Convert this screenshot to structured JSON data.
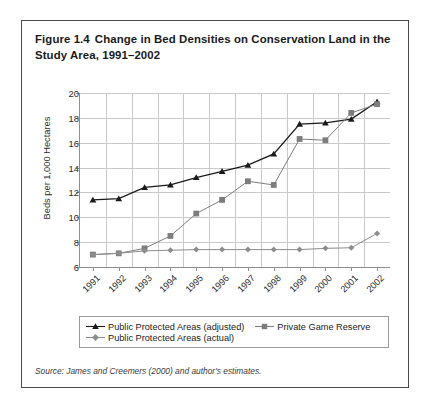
{
  "figure": {
    "number": "Figure 1.4",
    "title": "Change in Bed Densities on Conservation Land in the Study Area, 1991–2002",
    "source_note": "Source: James and Creemers (2000) and author's estimates."
  },
  "legend": {
    "entries": [
      {
        "label": "Public Protected Areas (adjusted)",
        "marker": "triangle-marker",
        "color": "#1a1a1a"
      },
      {
        "label": "Private Game Reserve",
        "marker": "square-marker",
        "color": "#7d7d7d"
      },
      {
        "label": "Public Protected Areas (actual)",
        "marker": "diamond-marker",
        "color": "#8c8c8c"
      }
    ]
  },
  "chart_data": {
    "type": "line",
    "title": "Change in Bed Densities on Conservation Land in the Study Area, 1991–2002",
    "xlabel": "",
    "ylabel": "Beds per 1,000 Hectares",
    "categories": [
      "1991",
      "1992",
      "1993",
      "1994",
      "1995",
      "1996",
      "1997",
      "1998",
      "1999",
      "2000",
      "2001",
      "2002"
    ],
    "ylim": [
      6,
      20
    ],
    "yticks": [
      6,
      8,
      10,
      12,
      14,
      16,
      18,
      20
    ],
    "grid": true,
    "legend_position": "bottom",
    "series": [
      {
        "name": "Public Protected Areas (adjusted)",
        "color": "#1a1a1a",
        "marker": "triangle",
        "values": [
          11.4,
          11.5,
          12.4,
          12.6,
          13.2,
          13.7,
          14.2,
          15.1,
          17.5,
          17.6,
          17.9,
          19.3
        ]
      },
      {
        "name": "Private Game Reserve",
        "color": "#7d7d7d",
        "marker": "square",
        "values": [
          7.0,
          7.1,
          7.5,
          8.5,
          10.3,
          11.4,
          12.9,
          12.6,
          16.3,
          16.2,
          18.4,
          19.1
        ]
      },
      {
        "name": "Public Protected Areas (actual)",
        "color": "#8c8c8c",
        "marker": "diamond",
        "values": [
          7.0,
          7.1,
          7.3,
          7.35,
          7.4,
          7.4,
          7.4,
          7.4,
          7.4,
          7.5,
          7.55,
          8.7
        ]
      }
    ]
  }
}
